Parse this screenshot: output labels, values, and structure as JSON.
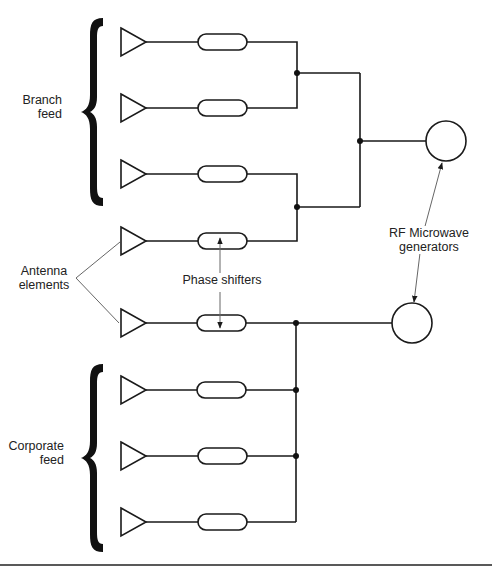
{
  "labels": {
    "branch_feed": [
      "Branch",
      "feed"
    ],
    "corporate_feed": [
      "Corporate",
      "feed"
    ],
    "antenna_elements": [
      "Antenna",
      "elements"
    ],
    "phase_shifters": "Phase shifters",
    "rf_generators": [
      "RF Microwave",
      "generators"
    ]
  },
  "diagram": {
    "antenna_rows_y": [
      42,
      108,
      174,
      241,
      323,
      390,
      456,
      522
    ],
    "groups": [
      {
        "name": "Branch feed",
        "rows": [
          0,
          1,
          2,
          3
        ],
        "topology": "binary tree"
      },
      {
        "name": "Corporate feed",
        "rows": [
          4,
          5,
          6,
          7
        ],
        "topology": "single bus"
      }
    ],
    "generators": 2,
    "stroke_color": "#1a1a1a",
    "annotation_color": "#777777"
  }
}
